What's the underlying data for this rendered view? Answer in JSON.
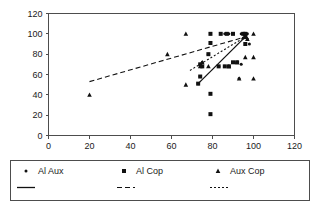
{
  "chart_data": {
    "type": "scatter",
    "title": "",
    "xlabel": "",
    "ylabel": "",
    "xlim": [
      0,
      120
    ],
    "ylim": [
      0,
      120
    ],
    "xticks": [
      0,
      20,
      40,
      60,
      80,
      100,
      120
    ],
    "yticks": [
      0,
      20,
      40,
      60,
      80,
      100,
      120
    ],
    "grid": false,
    "legend_position": "below",
    "series": [
      {
        "name": "Al Aux",
        "marker": "dot",
        "points": [
          [
            79,
            100
          ],
          [
            84,
            100
          ],
          [
            86,
            100
          ],
          [
            88,
            100
          ],
          [
            90,
            100
          ],
          [
            94,
            100
          ],
          [
            96,
            100
          ],
          [
            97,
            100
          ],
          [
            96,
            97
          ],
          [
            95,
            96
          ],
          [
            97,
            95
          ],
          [
            78,
            80
          ],
          [
            75,
            72
          ],
          [
            74,
            70
          ],
          [
            83,
            68
          ],
          [
            86,
            68
          ],
          [
            88,
            68
          ],
          [
            92,
            72
          ],
          [
            94,
            70
          ],
          [
            96,
            90
          ],
          [
            98,
            90
          ],
          [
            74,
            58
          ],
          [
            73,
            51
          ],
          [
            93,
            56
          ]
        ]
      },
      {
        "name": "Al Cop",
        "marker": "square",
        "points": [
          [
            79,
            100
          ],
          [
            84,
            100
          ],
          [
            87,
            100
          ],
          [
            90,
            100
          ],
          [
            95,
            100
          ],
          [
            96,
            100
          ],
          [
            79,
            91
          ],
          [
            78,
            80
          ],
          [
            74,
            70
          ],
          [
            75,
            68
          ],
          [
            83,
            68
          ],
          [
            86,
            68
          ],
          [
            88,
            68
          ],
          [
            90,
            72
          ],
          [
            92,
            72
          ],
          [
            96,
            97
          ],
          [
            96,
            90
          ],
          [
            74,
            58
          ],
          [
            73,
            51
          ],
          [
            79,
            41
          ],
          [
            79,
            21
          ]
        ]
      },
      {
        "name": "Aux Cop",
        "marker": "triangle",
        "points": [
          [
            20,
            40
          ],
          [
            58,
            80
          ],
          [
            67,
            100
          ],
          [
            67,
            50
          ],
          [
            75,
            72
          ],
          [
            74,
            68
          ],
          [
            78,
            68
          ],
          [
            88,
            68
          ],
          [
            92,
            72
          ],
          [
            96,
            97
          ],
          [
            97,
            95
          ],
          [
            100,
            100
          ],
          [
            100,
            77
          ],
          [
            96,
            77
          ],
          [
            100,
            56
          ],
          [
            93,
            56
          ]
        ]
      }
    ],
    "fits": [
      {
        "name": "Linear (Al Cop)",
        "style": "solid",
        "x": [
          73,
          96
        ],
        "y": [
          51,
          97
        ]
      },
      {
        "name": "Linear (Al Aux)",
        "style": "dashed",
        "x": [
          20,
          96
        ],
        "y": [
          53,
          97
        ]
      },
      {
        "name": "Linear (Aux Cop)",
        "style": "dotted",
        "x": [
          69,
          96
        ],
        "y": [
          64,
          97
        ]
      }
    ]
  },
  "axes": {
    "y_tick_labels": [
      "120",
      "100",
      "80",
      "60",
      "40",
      "20",
      "0"
    ],
    "x_tick_labels": [
      "0",
      "20",
      "40",
      "60",
      "80",
      "100",
      "120"
    ]
  },
  "legend": {
    "markers": [
      {
        "label": "Al Aux",
        "glyph": "dot"
      },
      {
        "label": "Al Cop",
        "glyph": "square"
      },
      {
        "label": "Aux Cop",
        "glyph": "triangle"
      }
    ],
    "lines": [
      {
        "label": "Linear (Al Cop)",
        "style": "solid"
      },
      {
        "label": "Linear (Al Aux)",
        "style": "dashed"
      },
      {
        "label": "Linear (Aux Cop)",
        "style": "dotted"
      }
    ]
  },
  "colors": {
    "ink": "#111111",
    "axis": "#4d4d4d",
    "background": "#ffffff"
  }
}
